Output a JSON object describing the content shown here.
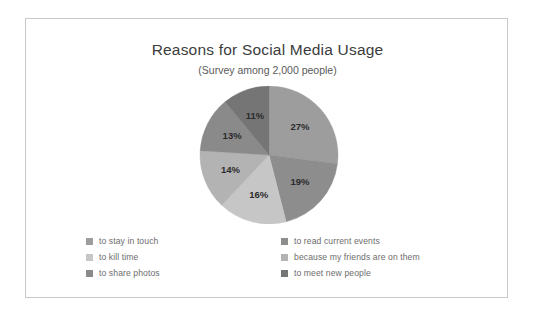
{
  "chart_data": {
    "type": "pie",
    "title": "Reasons for Social Media Usage",
    "subtitle": "(Survey among 2,000 people)",
    "categories": [
      "to stay in touch",
      "to read current events",
      "to kill time",
      "because my friends are on them",
      "to share photos",
      "to meet new people"
    ],
    "values": [
      27,
      19,
      16,
      14,
      13,
      11
    ],
    "value_labels": [
      "27%",
      "19%",
      "16%",
      "14%",
      "13%",
      "11%"
    ],
    "unit": "%",
    "colors": [
      "#9d9d9d",
      "#8d8d8d",
      "#c6c6c6",
      "#b3b3b3",
      "#8a8a8a",
      "#757575"
    ],
    "legend_position": "bottom",
    "grid": false,
    "start_angle_deg": 0,
    "direction": "clockwise"
  },
  "frame": {
    "border_color": "#c9c9c9"
  },
  "legend": {
    "columns": [
      {
        "items": [
          {
            "label": "to stay in touch",
            "color": "#9d9d9d"
          },
          {
            "label": "to kill time",
            "color": "#c6c6c6"
          },
          {
            "label": "to share photos",
            "color": "#8a8a8a"
          }
        ]
      },
      {
        "items": [
          {
            "label": "to read current events",
            "color": "#8d8d8d"
          },
          {
            "label": "because my friends are on them",
            "color": "#b3b3b3"
          },
          {
            "label": "to meet new people",
            "color": "#757575"
          }
        ]
      }
    ]
  }
}
